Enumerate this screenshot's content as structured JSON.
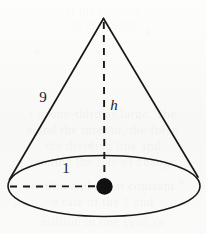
{
  "figure": {
    "kind": "cone-geometry-diagram",
    "labels": {
      "slant_height": "9",
      "radius": "1",
      "height": "h"
    },
    "geometry": {
      "apex": {
        "x": 103,
        "y": 18
      },
      "base_center": {
        "x": 104,
        "y": 186
      },
      "base_rx": 96,
      "base_ry": 31,
      "left_base_point": {
        "x": 9,
        "y": 179
      },
      "right_base_point": {
        "x": 198,
        "y": 177
      },
      "center_dot_radius": 8
    },
    "colors": {
      "ink": "#1a1a1a",
      "paper": "#fbfbfa",
      "ghost_text": "#5c544e"
    },
    "label_positions": {
      "slant_height": {
        "x": 43,
        "y": 102
      },
      "height": {
        "x": 113,
        "y": 110
      },
      "radius": {
        "x": 66,
        "y": 172
      }
    }
  },
  "ghost_text": {
    "lines": [
      {
        "text": "of the problem",
        "top": 4,
        "size": 12,
        "opacity": 0.1
      },
      {
        "text": "be estimated",
        "top": 18,
        "size": 12,
        "opacity": 0.09
      },
      {
        "text": "t is one-third as large. The",
        "top": 106,
        "size": 13,
        "opacity": 0.21
      },
      {
        "text": "e and the interior, the force",
        "top": 122,
        "size": 13,
        "opacity": 0.21
      },
      {
        "text": "the dividing line and",
        "top": 138,
        "size": 13,
        "opacity": 0.2
      },
      {
        "text": "imating the rate of change",
        "top": 154,
        "size": 13,
        "opacity": 0.19
      },
      {
        "text": "within a plane at constant",
        "top": 178,
        "size": 13,
        "opacity": 0.22
      },
      {
        "text": "e rate of the 1 and",
        "top": 194,
        "size": 13,
        "opacity": 0.21
      },
      {
        "text": "million in one year, or",
        "top": 214,
        "size": 13,
        "opacity": 0.2
      }
    ]
  }
}
